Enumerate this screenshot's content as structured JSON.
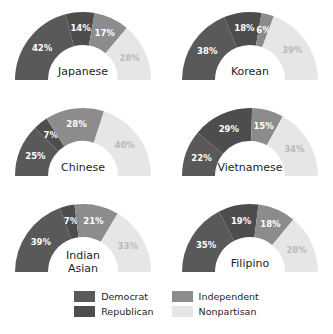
{
  "chart_data": {
    "type": "pie",
    "title": "",
    "subtitle": "",
    "variant": "half-donut",
    "legend_position": "bottom",
    "categories": [
      "Democrat",
      "Republican",
      "Independent",
      "Nonpartisan"
    ],
    "colors": {
      "Democrat": "#595959",
      "Republican": "#4d4d4d",
      "Independent": "#8c8c8c",
      "Nonpartisan": "#e6e6e6"
    },
    "label_colors": {
      "on_dark": "#ffffff",
      "on_light": "#b9b9b9"
    },
    "charts": [
      {
        "title": "Japanese",
        "title_lines": [
          "Japanese"
        ],
        "values": [
          42,
          14,
          17,
          28
        ],
        "labels": [
          "42%",
          "14%",
          "17%",
          "28%"
        ]
      },
      {
        "title": "Korean",
        "title_lines": [
          "Korean"
        ],
        "values": [
          38,
          18,
          6,
          39
        ],
        "labels": [
          "38%",
          "18%",
          "6%",
          "39%"
        ]
      },
      {
        "title": "Chinese",
        "title_lines": [
          "Chinese"
        ],
        "values": [
          25,
          7,
          28,
          40
        ],
        "labels": [
          "25%",
          "7%",
          "28%",
          "40%"
        ]
      },
      {
        "title": "Vietnamese",
        "title_lines": [
          "Vietnamese"
        ],
        "values": [
          22,
          29,
          15,
          34
        ],
        "labels": [
          "22%",
          "29%",
          "15%",
          "34%"
        ]
      },
      {
        "title": "Indian Asian",
        "title_lines": [
          "Indian",
          "Asian"
        ],
        "values": [
          39,
          7,
          21,
          33
        ],
        "labels": [
          "39%",
          "7%",
          "21%",
          "33%"
        ]
      },
      {
        "title": "Filipino",
        "title_lines": [
          "Filipino"
        ],
        "values": [
          35,
          19,
          18,
          28
        ],
        "labels": [
          "35%",
          "19%",
          "18%",
          "28%"
        ]
      }
    ]
  },
  "legend": {
    "items": [
      {
        "label": "Democrat",
        "color": "#595959"
      },
      {
        "label": "Independent",
        "color": "#8c8c8c"
      },
      {
        "label": "Republican",
        "color": "#4d4d4d"
      },
      {
        "label": "Nonpartisan",
        "color": "#e6e6e6"
      }
    ]
  }
}
